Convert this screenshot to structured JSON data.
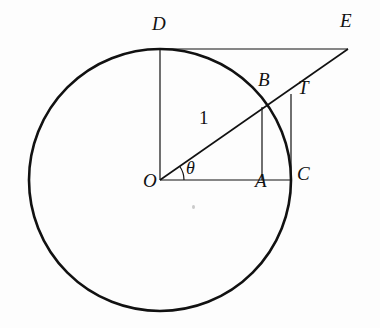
{
  "figure": {
    "kind": "geometry-diagram",
    "background_color": "#fdfdfd",
    "stroke_color": "#111111",
    "circle": {
      "center_label": "O",
      "center_x": 160,
      "center_y": 180,
      "radius": 131,
      "radius_value": "1",
      "stroke_width": 2.6
    },
    "angle": {
      "symbol": "θ",
      "vertex": "O",
      "arc_radius": 24,
      "degrees": 35
    },
    "points": [
      {
        "id": "O",
        "label": "O",
        "x": 160,
        "y": 180,
        "label_x": 143,
        "label_y": 182
      },
      {
        "id": "A",
        "label": "A",
        "x": 262,
        "y": 180,
        "label_x": 255,
        "label_y": 182
      },
      {
        "id": "B",
        "label": "B",
        "x": 264,
        "y": 108,
        "label_x": 258,
        "label_y": 78
      },
      {
        "id": "C",
        "label": "C",
        "x": 291,
        "y": 180,
        "label_x": 297,
        "label_y": 172
      },
      {
        "id": "D",
        "label": "D",
        "x": 160,
        "y": 49,
        "label_x": 152,
        "label_y": 22
      },
      {
        "id": "E",
        "label": "E",
        "x": 348,
        "y": 49,
        "label_x": 340,
        "label_y": 19
      },
      {
        "id": "T",
        "label": "T",
        "x": 291,
        "y": 94,
        "label_x": 298,
        "label_y": 86
      }
    ],
    "segments": [
      {
        "id": "OE",
        "from": "O",
        "to": "E",
        "description": "ray from center through B and T to E",
        "x1": 160,
        "y1": 180,
        "x2": 348,
        "y2": 49,
        "width": 1.6
      },
      {
        "id": "OC",
        "from": "O",
        "to": "C",
        "description": "horizontal radius to C",
        "x1": 160,
        "y1": 180,
        "x2": 291,
        "y2": 180,
        "width": 1.2
      },
      {
        "id": "OD",
        "from": "O",
        "to": "D",
        "description": "vertical radius to D",
        "x1": 160,
        "y1": 180,
        "x2": 160,
        "y2": 49,
        "width": 1.2
      },
      {
        "id": "DE",
        "from": "D",
        "to": "E",
        "description": "horizontal cotangent line from D to E",
        "x1": 160,
        "y1": 49,
        "x2": 348,
        "y2": 49,
        "width": 1.2
      },
      {
        "id": "AB",
        "from": "A",
        "to": "B",
        "description": "vertical sine segment",
        "x1": 262,
        "y1": 180,
        "x2": 262,
        "y2": 107,
        "width": 1.2
      },
      {
        "id": "CT",
        "from": "C",
        "to": "T",
        "description": "vertical tangent segment",
        "x1": 291,
        "y1": 180,
        "x2": 291,
        "y2": 94,
        "width": 1.2
      }
    ],
    "length_labels": [
      {
        "id": "radius-one",
        "text": "1",
        "x": 199,
        "y": 116
      }
    ],
    "marks": [
      {
        "id": "speck",
        "x": 192,
        "y": 207
      }
    ]
  }
}
